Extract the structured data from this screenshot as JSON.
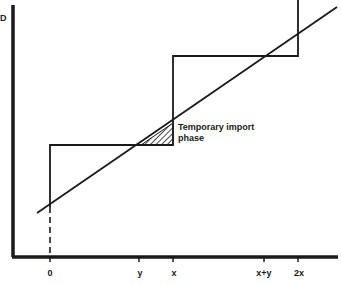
{
  "diagram": {
    "y_axis_label": "D",
    "x_ticks": [
      {
        "label": "0",
        "x": 50
      },
      {
        "label": "y",
        "x": 139
      },
      {
        "label": "x",
        "x": 173
      },
      {
        "label": "x+y",
        "x": 264
      },
      {
        "label": "2x",
        "x": 298
      }
    ],
    "annotation": {
      "line1": "Temporary import",
      "line2": "phase"
    },
    "colors": {
      "ink": "#1a1a1a",
      "background": "#ffffff"
    }
  }
}
